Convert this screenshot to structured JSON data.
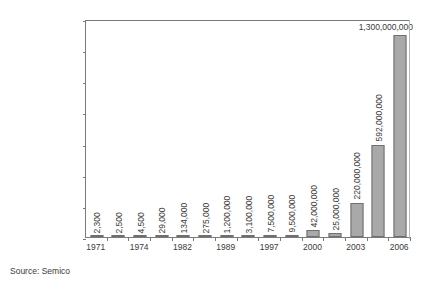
{
  "chart_data": {
    "type": "bar",
    "title": "",
    "subtitle": "",
    "xlabel": "",
    "ylabel": "",
    "ylim": [
      0,
      1400000000
    ],
    "grid": false,
    "legend": false,
    "categories": [
      "1971",
      "1972",
      "1974",
      "1978",
      "1982",
      "1985",
      "1989",
      "1993",
      "1997",
      "1999",
      "2000",
      "2002",
      "2003",
      "2004",
      "2006"
    ],
    "x_tick_labels": [
      "1971",
      "",
      "1974",
      "",
      "1982",
      "",
      "1989",
      "",
      "1997",
      "",
      "2000",
      "",
      "2003",
      "",
      "2006"
    ],
    "values": [
      2300,
      2500,
      4500,
      29000,
      134000,
      275000,
      1200000,
      3100000,
      7500000,
      9500000,
      42000000,
      25000000,
      220000000,
      592000000,
      1300000000
    ],
    "value_labels": [
      "2,300",
      "2,500",
      "4,500",
      "29,000",
      "134,000",
      "275,000",
      "1,200,000",
      "3,100,000",
      "7,500,000",
      "9,500,000",
      "42,000,000",
      "25,000,000",
      "220,000,000",
      "592,000,000",
      "1,300,000,000"
    ],
    "y_tick_values": [
      0,
      200000000,
      400000000,
      600000000,
      800000000,
      1000000000,
      1200000000,
      1400000000
    ],
    "y_tick_labels": [
      "0",
      "200,000,000",
      "400,000,000",
      "600,000,000",
      "800,000,000",
      "1,000,000,000",
      "1,200,000,000",
      "1,400,000,000"
    ],
    "bar_color": "#a9a9a9",
    "bar_border_color": "#6f6f6f",
    "axis_color": "#7a7a7a",
    "text_color": "#3a3a3a"
  },
  "source": {
    "text": "Source: Semico"
  }
}
